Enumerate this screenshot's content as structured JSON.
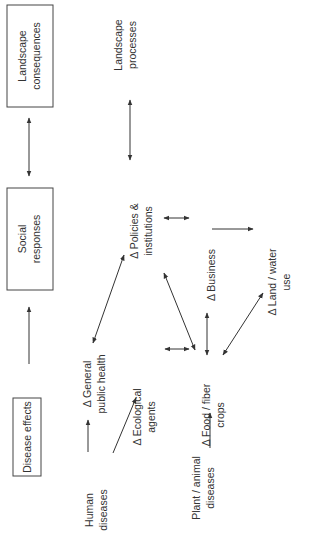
{
  "diagram": {
    "orientation": "rotated-90-ccw",
    "boxes": [
      {
        "id": "landscape_consequences",
        "lines": [
          "Landscape",
          "consequences"
        ]
      },
      {
        "id": "social_responses",
        "lines": [
          "Social",
          "responses"
        ]
      },
      {
        "id": "disease_effects",
        "lines": [
          "Disease effects"
        ]
      }
    ],
    "nodes": [
      {
        "id": "landscape_processes",
        "lines": [
          "Landscape",
          "processes"
        ]
      },
      {
        "id": "policies",
        "lines": [
          "Δ Policies &",
          "institutions"
        ]
      },
      {
        "id": "business",
        "lines": [
          "Δ Business"
        ]
      },
      {
        "id": "land_water",
        "lines": [
          "Δ Land / water",
          "use"
        ]
      },
      {
        "id": "public_health",
        "lines": [
          "Δ General",
          "public health"
        ]
      },
      {
        "id": "ecological",
        "lines": [
          "Δ Ecological",
          "agents"
        ]
      },
      {
        "id": "food_fiber",
        "lines": [
          "Δ Food / fiber",
          "crops"
        ]
      },
      {
        "id": "human_diseases",
        "lines": [
          "Human",
          "diseases"
        ]
      },
      {
        "id": "plant_animal",
        "lines": [
          "Plant / animal",
          "diseases"
        ]
      }
    ],
    "edges": [
      {
        "from": "landscape_consequences",
        "to": "social_responses",
        "type": "bidirectional"
      },
      {
        "from": "disease_effects",
        "to": "social_responses",
        "type": "directed"
      },
      {
        "from": "landscape_processes",
        "to": "land_water",
        "type": "bidirectional"
      },
      {
        "from": "public_health",
        "to": "policies",
        "type": "bidirectional"
      },
      {
        "from": "policies",
        "to": "business",
        "type": "bidirectional"
      },
      {
        "from": "policies",
        "to": "food_fiber",
        "type": "bidirectional"
      },
      {
        "from": "business",
        "to": "food_fiber",
        "type": "bidirectional"
      },
      {
        "from": "business",
        "to": "land_water",
        "type": "directed"
      },
      {
        "from": "food_fiber",
        "to": "land_water",
        "type": "bidirectional"
      },
      {
        "from": "ecological",
        "to": "food_fiber",
        "type": "bidirectional"
      },
      {
        "from": "human_diseases",
        "to": "public_health",
        "type": "directed"
      },
      {
        "from": "human_diseases",
        "to": "ecological",
        "type": "directed"
      },
      {
        "from": "plant_animal",
        "to": "food_fiber",
        "type": "directed"
      }
    ]
  }
}
